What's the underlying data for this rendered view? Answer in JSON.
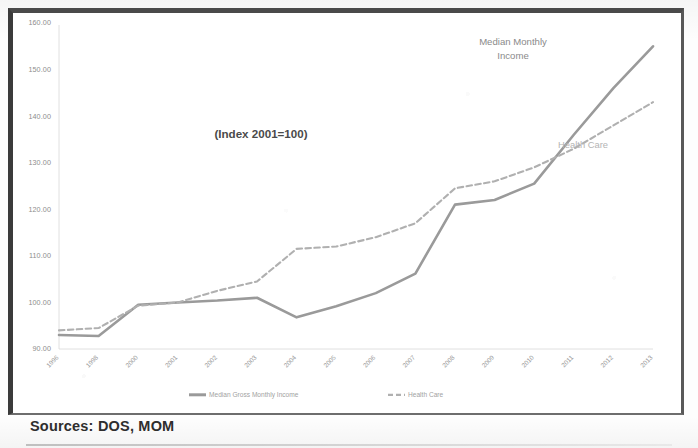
{
  "figure": {
    "sources_note": "Sources: DOS, MOM",
    "index_note": "(Index 2001=100)"
  },
  "annotations": {
    "income_line1": "Median Monthly",
    "income_line2": "Income",
    "health": "Health Care"
  },
  "legend": {
    "items": [
      {
        "label": "Median Gross Monthly Income",
        "style": "solid",
        "color": "#9a9a9a"
      },
      {
        "label": "Health Care",
        "style": "dashed",
        "color": "#b0b0b0"
      }
    ]
  },
  "axes": {
    "y_ticks": [
      "90.00",
      "100.00",
      "110.00",
      "120.00",
      "130.00",
      "140.00",
      "150.00",
      "160.00"
    ],
    "x_ticks": [
      "1996",
      "1998",
      "2000",
      "2001",
      "2002",
      "2003",
      "2004",
      "2005",
      "2006",
      "2007",
      "2008",
      "2009",
      "2010",
      "2011",
      "2012",
      "2013"
    ]
  },
  "chart_data": {
    "type": "line",
    "title": "",
    "subtitle": "(Index 2001=100)",
    "xlabel": "",
    "ylabel": "",
    "ylim": [
      90,
      160
    ],
    "ytick_step": 10,
    "grid": false,
    "legend_position": "bottom",
    "categories": [
      "1996",
      "1998",
      "2000",
      "2001",
      "2002",
      "2003",
      "2004",
      "2005",
      "2006",
      "2007",
      "2008",
      "2009",
      "2010",
      "2011",
      "2012",
      "2013"
    ],
    "series": [
      {
        "name": "Median Gross Monthly Income",
        "style": "solid",
        "color": "#9a9a9a",
        "annotation": "Median Monthly Income",
        "values": [
          93.0,
          92.8,
          99.5,
          100.0,
          100.4,
          101.0,
          96.8,
          99.2,
          102.0,
          106.2,
          121.0,
          122.0,
          125.5,
          136.0,
          146.0,
          155.0
        ]
      },
      {
        "name": "Health Care",
        "style": "dashed",
        "color": "#b0b0b0",
        "annotation": "Health Care",
        "values": [
          94.0,
          94.5,
          99.3,
          100.0,
          102.5,
          104.5,
          111.5,
          112.0,
          114.0,
          117.0,
          124.5,
          126.0,
          129.0,
          133.0,
          138.0,
          143.0
        ]
      }
    ]
  }
}
